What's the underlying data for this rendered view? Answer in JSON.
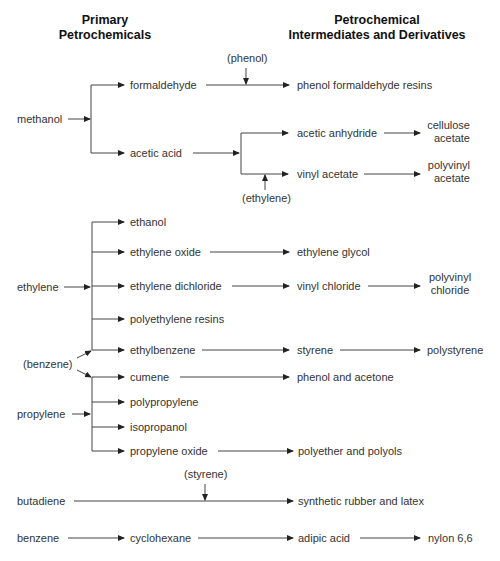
{
  "headers": {
    "primary": [
      "Primary",
      "Petrochemicals"
    ],
    "derivatives": [
      "Petrochemical",
      "Intermediates and Derivatives"
    ]
  },
  "nodes": {
    "methanol": "methanol",
    "formaldehyde": "formaldehyde",
    "phenol_reagent": "(phenol)",
    "phenol_formaldehyde_resins": "phenol formaldehyde resins",
    "acetic_acid": "acetic acid",
    "acetic_anhydride": "acetic anhydride",
    "cellulose_acetate": [
      "cellulose",
      "acetate"
    ],
    "vinyl_acetate": "vinyl acetate",
    "polyvinyl_acetate": [
      "polyvinyl",
      "acetate"
    ],
    "ethylene_reagent": "(ethylene)",
    "ethylene": "ethylene",
    "ethanol": "ethanol",
    "ethylene_oxide": "ethylene oxide",
    "ethylene_glycol": "ethylene glycol",
    "ethylene_dichloride": "ethylene dichloride",
    "vinyl_chloride": "vinyl chloride",
    "polyvinyl_chloride": [
      "polyvinyl",
      "chloride"
    ],
    "polyethylene_resins": "polyethylene resins",
    "benzene_reagent": "(benzene)",
    "ethylbenzene": "ethylbenzene",
    "styrene": "styrene",
    "polystyrene": "polystyrene",
    "cumene": "cumene",
    "phenol_and_acetone": "phenol and acetone",
    "propylene": "propylene",
    "polypropylene": "polypropylene",
    "isopropanol": "isopropanol",
    "propylene_oxide": "propylene oxide",
    "polyether_and_polyols": "polyether and polyols",
    "styrene_reagent": "(styrene)",
    "butadiene": "butadiene",
    "synthetic_rubber_and_latex": "synthetic rubber and latex",
    "benzene": "benzene",
    "cyclohexane": "cyclohexane",
    "adipic_acid": "adipic acid",
    "nylon_6_6": "nylon 6,6"
  },
  "colors": {
    "line": "#333333",
    "text": "#333333",
    "header": "#111111"
  }
}
